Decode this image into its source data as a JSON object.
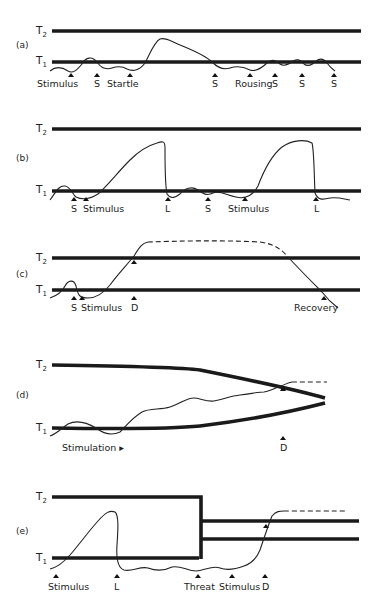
{
  "figure": {
    "panels": [
      {
        "id": "a",
        "label": "(a)",
        "thresholds": {
          "upper": "T",
          "upper_sub": "2",
          "lower": "T",
          "lower_sub": "1"
        },
        "markers": [
          "Stimulus",
          "S",
          "Startle",
          "S",
          "Rousing",
          "S",
          "S",
          "S"
        ]
      },
      {
        "id": "b",
        "label": "(b)",
        "thresholds": {
          "upper": "T",
          "upper_sub": "2",
          "lower": "T",
          "lower_sub": "1"
        },
        "markers": [
          "S",
          "Stimulus",
          "L",
          "S",
          "Stimulus",
          "L"
        ]
      },
      {
        "id": "c",
        "label": "(c)",
        "thresholds": {
          "upper": "T",
          "upper_sub": "2",
          "lower": "T",
          "lower_sub": "1"
        },
        "markers": [
          "S",
          "Stimulus",
          "D",
          "Recovery"
        ]
      },
      {
        "id": "d",
        "label": "(d)",
        "thresholds": {
          "upper": "T",
          "upper_sub": "2",
          "lower": "T",
          "lower_sub": "1"
        },
        "markers": [
          "Stimulation ▸",
          "D"
        ]
      },
      {
        "id": "e",
        "label": "(e)",
        "thresholds": {
          "upper": "T",
          "upper_sub": "2",
          "lower": "T",
          "lower_sub": "1"
        },
        "markers": [
          "Stimulus",
          "L",
          "Threat",
          "Stimulus",
          "D"
        ]
      }
    ]
  }
}
